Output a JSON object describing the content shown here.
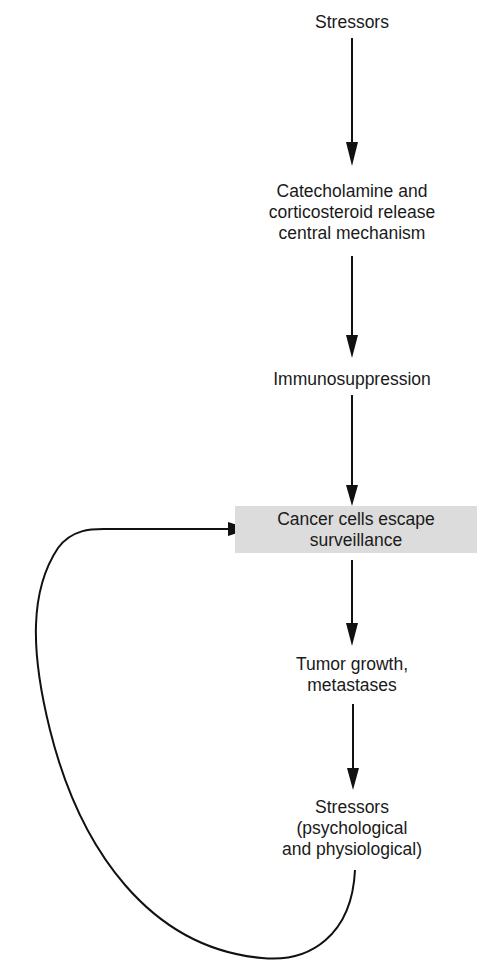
{
  "diagram": {
    "nodes": [
      {
        "id": "stressors",
        "lines": [
          "Stressors"
        ]
      },
      {
        "id": "hormone-release",
        "lines": [
          "Catecholamine and",
          "corticosteroid release",
          "central mechanism"
        ]
      },
      {
        "id": "immunosuppression",
        "lines": [
          "Immunosuppression"
        ]
      },
      {
        "id": "cancer-escape",
        "lines": [
          "Cancer cells escape",
          "surveillance"
        ],
        "highlighted": true,
        "fill": "#dcdcdc"
      },
      {
        "id": "tumor-growth",
        "lines": [
          "Tumor growth,",
          "metastases"
        ]
      },
      {
        "id": "stressors-2",
        "lines": [
          "Stressors",
          "(psychological",
          "and physiological)"
        ]
      }
    ],
    "edges": [
      {
        "from": "stressors",
        "to": "hormone-release"
      },
      {
        "from": "hormone-release",
        "to": "immunosuppression"
      },
      {
        "from": "immunosuppression",
        "to": "cancer-escape"
      },
      {
        "from": "cancer-escape",
        "to": "tumor-growth"
      },
      {
        "from": "tumor-growth",
        "to": "stressors-2"
      },
      {
        "from": "stressors-2",
        "to": "cancer-escape",
        "type": "feedback-loop"
      }
    ]
  }
}
